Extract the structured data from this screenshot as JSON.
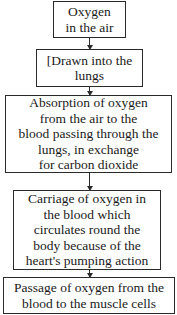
{
  "diagram": {
    "type": "flowchart",
    "direction": "top-to-bottom",
    "steps": [
      {
        "label": "Oxygen\nin the air"
      },
      {
        "label": "[Drawn into the\nlungs"
      },
      {
        "label": "Absorption of oxygen\nfrom the air to the\nblood passing through the\nlungs, in exchange\nfor carbon dioxide"
      },
      {
        "label": "Carriage of oxygen in\nthe blood which\ncirculates round the\nbody because of the\nheart's pumping action"
      },
      {
        "label": "Passage of oxygen from the\nblood to the muscle cells"
      }
    ],
    "colors": {
      "border": "#2a2a2a",
      "text": "#1a1a1a",
      "background": "#ffffff"
    }
  }
}
